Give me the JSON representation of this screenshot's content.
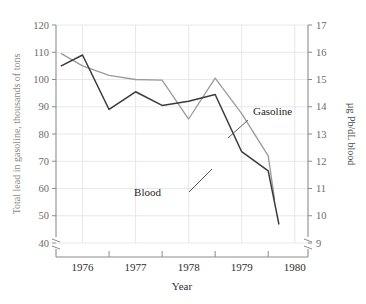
{
  "chart_data": {
    "type": "line",
    "title": "",
    "xlabel": "Year",
    "ylabel_left": "Total lead in gasoline, thousands of tons",
    "ylabel_right": "µg Pb/dL blood",
    "xlim": [
      1975.5,
      1980.25
    ],
    "x_ticks": [
      1976,
      1977,
      1978,
      1979,
      1980
    ],
    "x_tick_labels": [
      "1976",
      "1977",
      "1978",
      "1979",
      "1980"
    ],
    "x_minor_ticks": [
      1976.5,
      1977.5,
      1978.5,
      1979.5
    ],
    "ylim_left": [
      40,
      120
    ],
    "y_ticks_left": [
      40,
      50,
      60,
      70,
      80,
      90,
      100,
      110,
      120
    ],
    "y_tick_labels_left": [
      "40",
      "50",
      "60",
      "70",
      "80",
      "90",
      "100",
      "110",
      "120"
    ],
    "ylim_right": [
      9,
      17
    ],
    "y_ticks_right": [
      9,
      10,
      11,
      12,
      13,
      14,
      15,
      16,
      17
    ],
    "y_tick_labels_right": [
      "9",
      "10",
      "11",
      "12",
      "13",
      "14",
      "15",
      "16",
      "17"
    ],
    "grid": true,
    "axis_break_left": true,
    "axis_break_right": true,
    "legend_position": "inline-annotations",
    "colors": {
      "gasoline": "#9b9b9b",
      "blood": "#3a3a3a",
      "grid": "#e2e2e2",
      "axis": "#8c8c8c",
      "left_label": "#8a8a8a"
    },
    "series": [
      {
        "name": "Gasoline",
        "axis": "left",
        "color": "#9b9b9b",
        "x": [
          1975.6,
          1976.0,
          1976.5,
          1977.0,
          1977.5,
          1978.0,
          1978.5,
          1979.0,
          1979.5,
          1979.62
        ],
        "values": [
          109.5,
          105.0,
          101.5,
          100.0,
          99.8,
          85.5,
          100.5,
          87.5,
          72.0,
          56.0
        ]
      },
      {
        "name": "Blood",
        "axis": "right",
        "color": "#3a3a3a",
        "x": [
          1975.6,
          1976.0,
          1976.5,
          1977.0,
          1977.5,
          1978.0,
          1978.5,
          1979.0,
          1979.5,
          1979.7
        ],
        "values_left_equiv": [
          105.0,
          109.0,
          89.0,
          95.5,
          90.5,
          92.0,
          94.5,
          73.5,
          66.5,
          47.0
        ],
        "values": [
          15.5,
          15.9,
          13.9,
          14.55,
          14.05,
          14.2,
          14.45,
          12.35,
          11.65,
          9.7
        ]
      }
    ],
    "annotations": [
      {
        "name": "Gasoline",
        "label": "Gasoline",
        "label_x": 253,
        "label_y": 115,
        "leader_from_x": 248,
        "leader_from_y": 120,
        "leader_to_x": 228,
        "leader_to_y": 138
      },
      {
        "name": "Blood",
        "label": "Blood",
        "label_x": 161,
        "label_y": 196,
        "leader_from_x": 189,
        "leader_from_y": 192,
        "leader_to_x": 212,
        "leader_to_y": 169
      }
    ]
  },
  "axes": {
    "left_title": "Total lead in gasoline, thousands of tons",
    "right_title": "µg Pb/dL blood",
    "x_title": "Year"
  }
}
